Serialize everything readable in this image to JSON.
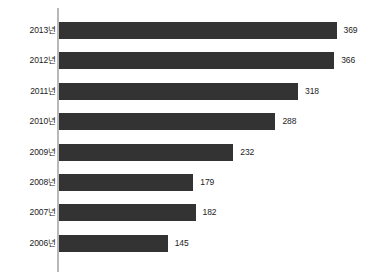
{
  "chart_data": {
    "type": "bar",
    "orientation": "horizontal",
    "title": "",
    "subtitle": "",
    "xlabel": "",
    "ylabel": "",
    "grid": false,
    "legend": null,
    "legend_position": "none",
    "xlim": [
      0,
      369
    ],
    "categories": [
      "2013년",
      "2012년",
      "2011년",
      "2010년",
      "2009년",
      "2008년",
      "2007년",
      "2006년"
    ],
    "values": [
      369,
      366,
      318,
      288,
      232,
      179,
      182,
      145
    ],
    "value_labels": [
      "369",
      "366",
      "318",
      "288",
      "232",
      "179",
      "182",
      "145"
    ],
    "bar_color": "#333333",
    "axis_color": "#b8b8b8",
    "label_color": "#1c1c1c",
    "background_color": "#ffffff",
    "bars": [
      {
        "category": "2013년",
        "value": 369,
        "label": "369"
      },
      {
        "category": "2012년",
        "value": 366,
        "label": "366"
      },
      {
        "category": "2011년",
        "value": 318,
        "label": "318"
      },
      {
        "category": "2010년",
        "value": 288,
        "label": "288"
      },
      {
        "category": "2009년",
        "value": 232,
        "label": "232"
      },
      {
        "category": "2008년",
        "value": 179,
        "label": "179"
      },
      {
        "category": "2007년",
        "value": 182,
        "label": "182"
      },
      {
        "category": "2006년",
        "value": 145,
        "label": "145"
      }
    ]
  }
}
